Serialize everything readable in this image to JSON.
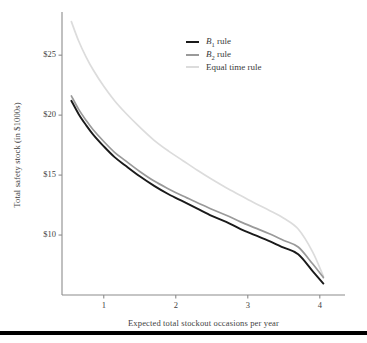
{
  "figure": {
    "background": "#ffffff",
    "footer_rule_color": "#000000"
  },
  "chart_data": {
    "type": "line",
    "title": "",
    "xlabel": "Expected total stockout occasions per year",
    "ylabel": "Total safety stock (in $1000s)",
    "xlim": [
      0.42,
      4.35
    ],
    "ylim": [
      5.0,
      28.6
    ],
    "xticks": [
      1,
      2,
      3,
      4
    ],
    "xtick_labels": [
      "1",
      "2",
      "3",
      "4"
    ],
    "yticks": [
      10,
      15,
      20,
      25
    ],
    "ytick_labels": [
      "$10",
      "$15",
      "$20",
      "$25"
    ],
    "grid": false,
    "legend_position": "upper right",
    "legend": [
      "B1 rule",
      "B2 rule",
      "Equal time rule"
    ],
    "x": [
      0.55,
      0.65,
      0.75,
      0.85,
      1.0,
      1.15,
      1.3,
      1.5,
      1.7,
      1.9,
      2.1,
      2.3,
      2.5,
      2.7,
      2.9,
      3.1,
      3.3,
      3.5,
      3.7,
      3.9,
      4.05
    ],
    "series": [
      {
        "name": "B1 rule",
        "label": "B1 rule",
        "color": "#1a1a1a",
        "values": [
          21.2,
          20.1,
          19.2,
          18.4,
          17.4,
          16.5,
          15.8,
          14.9,
          14.1,
          13.4,
          12.8,
          12.2,
          11.6,
          11.1,
          10.5,
          10.0,
          9.5,
          8.95,
          8.4,
          7.0,
          5.95
        ]
      },
      {
        "name": "B2 rule",
        "label": "B2 rule",
        "color": "#9a9a9a",
        "values": [
          21.6,
          20.5,
          19.6,
          18.8,
          17.8,
          16.9,
          16.2,
          15.3,
          14.5,
          13.85,
          13.25,
          12.7,
          12.15,
          11.65,
          11.1,
          10.6,
          10.1,
          9.55,
          9.0,
          7.6,
          6.45
        ]
      },
      {
        "name": "Equal time rule",
        "label": "Equal time rule",
        "color": "#dcdcdc",
        "values": [
          27.8,
          26.2,
          24.9,
          23.8,
          22.4,
          21.2,
          20.2,
          19.0,
          17.9,
          17.0,
          16.2,
          15.4,
          14.65,
          13.95,
          13.3,
          12.65,
          12.05,
          11.4,
          10.5,
          8.6,
          6.55
        ]
      }
    ]
  },
  "legend_markup": [
    {
      "html": "<i>B</i><sub>1</sub> rule",
      "color": "#1a1a1a"
    },
    {
      "html": "<i>B</i><sub>2</sub> rule",
      "color": "#9a9a9a"
    },
    {
      "html": "Equal time rule",
      "color": "#dcdcdc"
    }
  ],
  "axes": {
    "spine_color": "#8c8c8c",
    "tick_color": "#8c8c8c"
  }
}
